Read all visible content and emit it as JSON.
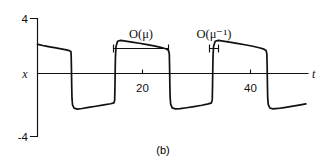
{
  "figure": {
    "caption": "(b)",
    "axis_x_label": "t",
    "axis_y_label": "x"
  },
  "annotations": {
    "slow_phase": {
      "symbol": "O",
      "arg": "(μ)",
      "label": "O(μ)"
    },
    "fast_phase": {
      "symbol": "O",
      "arg": "(μ⁻¹)",
      "label": "O(μ⁻¹)"
    }
  },
  "chart_data": {
    "type": "line",
    "title": "",
    "subtitle": "",
    "xlabel": "t",
    "ylabel": "x",
    "xlim": [
      0,
      51
    ],
    "ylim": [
      -4,
      4
    ],
    "grid": false,
    "legend": null,
    "y_tick_labels": [
      "4",
      "-4"
    ],
    "y_ticks": [
      4,
      -4
    ],
    "x_tick_labels": [
      "20",
      "40"
    ],
    "x_ticks": [
      20,
      40
    ],
    "annotations": [
      {
        "text": "O(μ)",
        "type": "span-bracket",
        "x_start": 14.6,
        "x_end": 24.8,
        "y": 2.95,
        "describes": "slow relaxation branch duration"
      },
      {
        "text": "O(μ⁻¹)",
        "type": "span-bracket",
        "x_start": 32.4,
        "x_end": 34.1,
        "y": 2.95,
        "describes": "fast jump duration"
      }
    ],
    "series": [
      {
        "name": "x(t) relaxation oscillation",
        "color": "#111111",
        "x": [
          0.0,
          0.5,
          1.0,
          1.6,
          2.3,
          3.2,
          4.2,
          5.2,
          6.0,
          6.3,
          6.35,
          6.4,
          6.45,
          6.5,
          6.6,
          6.9,
          7.5,
          8.4,
          9.6,
          11.0,
          12.5,
          13.8,
          14.4,
          14.55,
          14.6,
          14.65,
          14.7,
          14.8,
          15.1,
          15.7,
          16.6,
          17.8,
          19.2,
          20.7,
          22.2,
          23.4,
          24.3,
          24.7,
          24.85,
          24.9,
          24.95,
          25.0,
          25.1,
          25.4,
          26.0,
          26.9,
          28.1,
          29.5,
          31.0,
          32.2,
          32.8,
          32.95,
          33.0,
          33.05,
          33.1,
          33.2,
          33.5,
          34.1,
          35.0,
          36.2,
          37.6,
          39.1,
          40.6,
          41.8,
          42.7,
          43.1,
          43.25,
          43.3,
          43.35,
          43.4,
          43.5,
          43.8,
          44.4,
          45.3,
          46.5,
          47.9,
          49.3,
          50.6
        ],
        "y": [
          2.25,
          2.21,
          2.17,
          2.13,
          2.08,
          2.02,
          1.96,
          1.89,
          1.82,
          1.76,
          1.5,
          0.6,
          -0.6,
          -1.4,
          -1.85,
          -2.08,
          -2.14,
          -2.1,
          -2.03,
          -1.95,
          -1.86,
          -1.78,
          -1.72,
          -1.55,
          -0.7,
          0.5,
          1.45,
          2.1,
          2.46,
          2.52,
          2.47,
          2.4,
          2.32,
          2.23,
          2.13,
          2.03,
          1.93,
          1.84,
          1.6,
          0.8,
          -0.4,
          -1.3,
          -1.8,
          -2.06,
          -2.13,
          -2.11,
          -2.05,
          -1.97,
          -1.88,
          -1.79,
          -1.72,
          -1.5,
          -0.6,
          0.6,
          1.5,
          2.12,
          2.46,
          2.52,
          2.47,
          2.4,
          2.31,
          2.22,
          2.12,
          2.02,
          1.92,
          1.83,
          1.58,
          0.75,
          -0.45,
          -1.35,
          -1.82,
          -2.07,
          -2.13,
          -2.1,
          -2.04,
          -1.96,
          -1.87,
          -1.79
        ]
      }
    ]
  }
}
